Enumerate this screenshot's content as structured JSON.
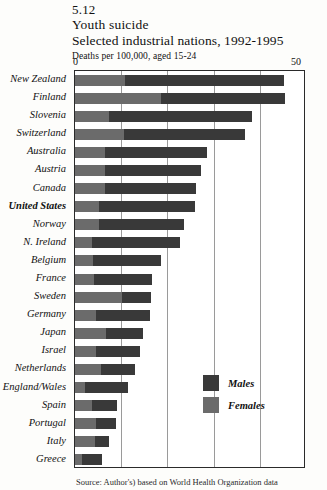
{
  "header": {
    "figure_number": "5.12",
    "title": "Youth suicide",
    "subtitle": "Selected industrial nations, 1992-1995",
    "units": "Deaths per 100,000, aged 15-24"
  },
  "axis": {
    "min_label": "0",
    "max_label": "50"
  },
  "legend": {
    "males_label": "Males",
    "females_label": "Females"
  },
  "source": {
    "text": "Source: Author's)  based  on  World  Health  Organization  data"
  },
  "colors": {
    "males": "#393939",
    "females": "#6b6b6b",
    "frame": "#2a2a2a",
    "gridline": "#9a9a9a",
    "page_background": "#fdfdfb"
  },
  "chart_data": {
    "type": "bar",
    "orientation": "horizontal",
    "stacked": true,
    "title": "Youth suicide",
    "subtitle": "Selected industrial nations, 1992-1995",
    "xlabel": "Deaths per 100,000, aged 15-24",
    "ylabel": "",
    "xlim": [
      0,
      50
    ],
    "xticks": [
      0,
      10,
      20,
      30,
      40,
      50
    ],
    "grid": true,
    "legend_position": "inside-right-lower",
    "categories": [
      "New Zealand",
      "Finland",
      "Slovenia",
      "Switzerland",
      "Australia",
      "Austria",
      "Canada",
      "United States",
      "Norway",
      "N. Ireland",
      "Belgium",
      "France",
      "Sweden",
      "Germany",
      "Japan",
      "Israel",
      "Netherlands",
      "England/Wales",
      "Spain",
      "Portugal",
      "Italy",
      "Greece"
    ],
    "highlighted_category": "United States",
    "series": [
      {
        "name": "Females",
        "values": [
          10.8,
          18.7,
          7.4,
          10.6,
          6.4,
          6.6,
          6.4,
          5.2,
          5.1,
          3.6,
          4.0,
          4.2,
          10.2,
          4.5,
          6.8,
          4.6,
          5.7,
          2.2,
          3.6,
          4.6,
          4.4,
          1.5
        ]
      },
      {
        "name": "Males",
        "values": [
          34.4,
          26.7,
          31.0,
          26.2,
          22.1,
          20.6,
          19.7,
          20.7,
          18.6,
          19.2,
          14.6,
          12.4,
          6.3,
          11.7,
          8.0,
          9.4,
          7.2,
          9.2,
          5.6,
          4.3,
          3.0,
          4.3
        ]
      }
    ],
    "totals": [
      45.2,
      45.4,
      38.4,
      36.8,
      28.5,
      27.2,
      26.1,
      25.9,
      23.7,
      22.8,
      18.6,
      16.6,
      16.5,
      16.2,
      14.8,
      14.0,
      12.9,
      11.4,
      9.2,
      8.9,
      7.4,
      5.8
    ]
  }
}
